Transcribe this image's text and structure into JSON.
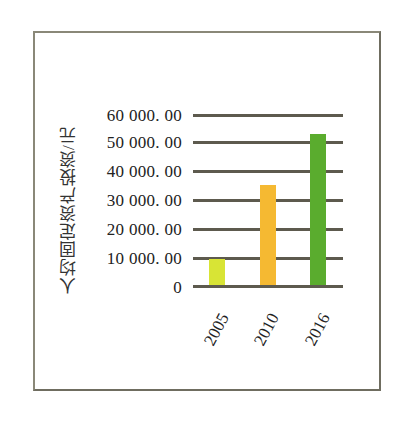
{
  "chart_data": {
    "type": "bar",
    "title": "",
    "xlabel": "",
    "ylabel": "人均固定资产投资/元",
    "categories": [
      "2005",
      "2010",
      "2016"
    ],
    "values": [
      9300,
      35500,
      53300
    ],
    "colors": [
      "#d8e435",
      "#f5b932",
      "#5aac2e"
    ],
    "ylim": [
      0,
      60000
    ],
    "yticks": [
      "0",
      "10 000. 00",
      "20 000. 00",
      "30 000. 00",
      "40 000. 00",
      "50 000. 00",
      "60 000. 00"
    ],
    "grid": true,
    "legend": null
  }
}
